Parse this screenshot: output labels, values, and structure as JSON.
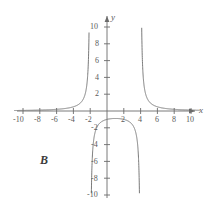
{
  "figure": {
    "panel_label": "B",
    "line_color": "#7a7a7a",
    "axis_color": "#6b6b6b",
    "text_color": "#5a5a5a",
    "background": "#ffffff"
  },
  "chart_data": {
    "type": "line",
    "title": "",
    "xlabel": "x",
    "ylabel": "y",
    "xlim": [
      -11,
      11
    ],
    "ylim": [
      -11,
      11
    ],
    "grid": false,
    "legend": null,
    "xticks": [
      -10,
      -8,
      -6,
      -4,
      -2,
      2,
      4,
      6,
      8,
      10
    ],
    "xtick_labels": [
      "-10",
      "-8",
      "-6",
      "-4",
      "-2",
      "2",
      "4",
      "6",
      "8",
      "10"
    ],
    "yticks": [
      10,
      8,
      6,
      4,
      2,
      -2,
      -4,
      -6,
      -8,
      -10
    ],
    "ytick_labels": [
      "10",
      "8",
      "6",
      "4",
      "2",
      "-2",
      "-4",
      "-6",
      "-8",
      "-10"
    ],
    "function": "y = 8 / ((x + 2)(x - 4))",
    "vertical_asymptotes": [
      -2,
      4
    ],
    "horizontal_asymptote": 0,
    "clip_y": [
      -10,
      10
    ],
    "branches": [
      {
        "name": "left-branch",
        "domain": [
          -11,
          -2
        ],
        "description": "approaches 0 from above as x decreases, rises to +10 near x=-2"
      },
      {
        "name": "middle-branch",
        "domain": [
          -2,
          4
        ],
        "description": "falls from -10 near x=-2, peaks at about y=-0.5 near x=1, falls to -10 near x=4"
      },
      {
        "name": "right-branch",
        "domain": [
          4,
          11
        ],
        "description": "drops from +10 near x=4 and decays toward 0 from above"
      }
    ],
    "annotations": [
      {
        "text": "B",
        "x": -7.2,
        "y": -5.8
      }
    ]
  }
}
